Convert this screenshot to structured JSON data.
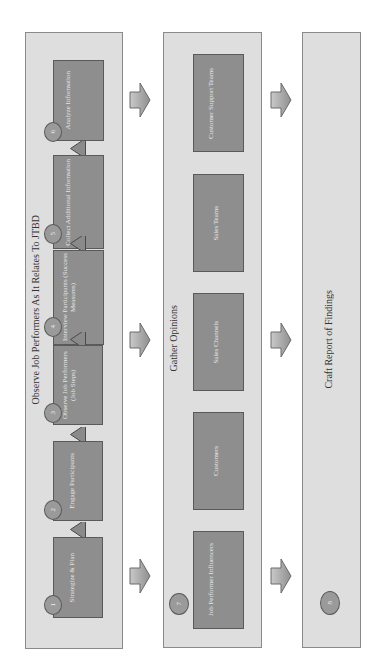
{
  "diagram": {
    "orientation": "rotated 90 degrees counter-clockwise",
    "panels": [
      {
        "title": "Observe Job Performers As It Relates To JTBD",
        "steps": [
          {
            "number": "1",
            "label": "Strategize & Plan"
          },
          {
            "number": "2",
            "label": "Engage Participants"
          },
          {
            "number": "3",
            "label": "Observe Job Performers (Job Steps)"
          },
          {
            "number": "4",
            "label": "Interview Participants (Success Measures)"
          },
          {
            "number": "5",
            "label": "Collect Additional Information"
          },
          {
            "number": "6",
            "label": "Analyze Information"
          }
        ]
      },
      {
        "title": "Gather Opinions",
        "number": "7",
        "items": [
          {
            "label": "Job Performer Influencers"
          },
          {
            "label": "Customers"
          },
          {
            "label": "Sales Channels"
          },
          {
            "label": "Sales Teams"
          },
          {
            "label": "Customer Support Teams"
          }
        ]
      },
      {
        "title": "Craft Report of Findings",
        "number": "8"
      }
    ],
    "colors": {
      "panel_fill": "#dedede",
      "box_fill": "#8e8e8e",
      "circle_fill": "#9a9a9a",
      "border": "#5a5a5a"
    }
  }
}
